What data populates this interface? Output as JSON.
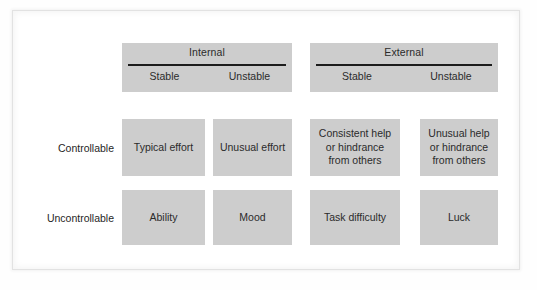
{
  "figure": {
    "type": "attribution-matrix",
    "colors": {
      "cell_fill": "#cdcdcd",
      "rule": "#1c1c1c",
      "text": "#2b2b2b",
      "page_background": "#ffffff",
      "frame_border": "#e2e2e2"
    }
  },
  "column_groups": [
    {
      "title": "Internal",
      "subcolumns": [
        "Stable",
        "Unstable"
      ]
    },
    {
      "title": "External",
      "subcolumns": [
        "Stable",
        "Unstable"
      ]
    }
  ],
  "row_labels": [
    "Controllable",
    "Uncontrollable"
  ],
  "cells": {
    "controllable": {
      "internal_stable": "Typical effort",
      "internal_unstable": "Unusual effort",
      "external_stable": "Consistent help\nor hindrance\nfrom others",
      "external_unstable": "Unusual help\nor hindrance\nfrom others"
    },
    "uncontrollable": {
      "internal_stable": "Ability",
      "internal_unstable": "Mood",
      "external_stable": "Task difficulty",
      "external_unstable": "Luck"
    }
  }
}
